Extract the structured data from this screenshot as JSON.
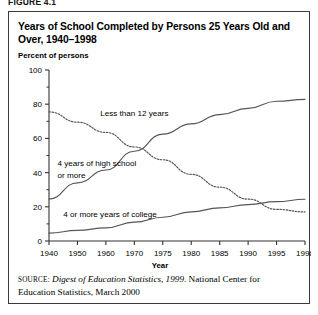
{
  "figure": {
    "label": "FIGURE 4.1"
  },
  "title": "Years of School Completed by Persons 25 Years Old and Over, 1940–1998",
  "source": {
    "kicker": "SOURCE:",
    "italic_part": "Digest of Education Statistics, 1999",
    "rest": ". National Center for Education Statistics, March 2000"
  },
  "colors": {
    "line": "#555555",
    "axis": "#333333",
    "border": "#3a3a3a",
    "text": "#000000",
    "background": "#ffffff"
  },
  "chart_data": {
    "type": "line",
    "title": "Years of School Completed by Persons 25 Years Old and Over, 1940–1998",
    "xlabel": "Year",
    "ylabel": "Percent of persons",
    "ylim": [
      0,
      100
    ],
    "yticks": [
      0,
      20,
      40,
      60,
      80,
      100
    ],
    "ytick_labels": [
      "0",
      "20",
      "40",
      "60",
      "80",
      "100"
    ],
    "yminor_ticks": [
      10,
      30,
      50,
      70,
      90
    ],
    "grid": false,
    "legend_position": "inline-annotations",
    "xticks": [
      1940,
      1950,
      1960,
      1970,
      1975,
      1980,
      1985,
      1990,
      1995,
      1998
    ],
    "xtick_labels": [
      "1940",
      "1950",
      "1960",
      "1970",
      "1975",
      "1980",
      "1985",
      "1990",
      "1995",
      "1998"
    ],
    "x_axis_note": "Non-uniform spacing: decades 1940-1970, then 5-year steps to 1995, then 1998",
    "series": [
      {
        "name": "Less than 12 years",
        "style": "dotted",
        "x": [
          1940,
          1950,
          1960,
          1970,
          1975,
          1980,
          1985,
          1990,
          1995,
          1998
        ],
        "values": [
          75.5,
          69.5,
          63.5,
          55.0,
          47.5,
          39.0,
          31.5,
          24.5,
          18.5,
          17.0
        ]
      },
      {
        "name": "4 years of high school or more",
        "style": "solid",
        "x": [
          1940,
          1950,
          1960,
          1970,
          1975,
          1980,
          1985,
          1990,
          1995,
          1998
        ],
        "values": [
          24.5,
          34.0,
          41.5,
          52.5,
          62.5,
          68.5,
          73.9,
          77.6,
          81.7,
          82.8
        ]
      },
      {
        "name": "4 or more years of college",
        "style": "solid",
        "x": [
          1940,
          1950,
          1960,
          1970,
          1975,
          1980,
          1985,
          1990,
          1995,
          1998
        ],
        "values": [
          4.6,
          6.2,
          7.7,
          11.0,
          13.9,
          17.0,
          19.4,
          21.3,
          23.0,
          24.4
        ]
      }
    ],
    "annotations": [
      {
        "text": "Less than 12 years",
        "x": 1958,
        "y": 73
      },
      {
        "text": "4 years of high school",
        "x": 1943,
        "y": 44
      },
      {
        "text": "or more",
        "x": 1943,
        "y": 37
      },
      {
        "text": "4 or more years of college",
        "x": 1945,
        "y": 14
      }
    ]
  }
}
